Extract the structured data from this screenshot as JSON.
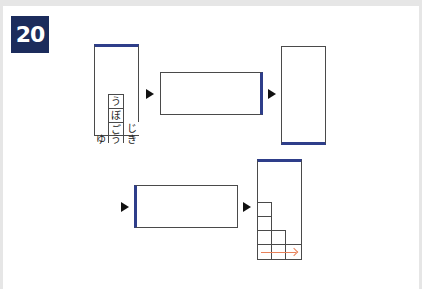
{
  "problem": {
    "number": "20"
  },
  "colors": {
    "badge_bg": "#1c2c5c",
    "accent": "#2e3e8a",
    "arrow_hint": "#e8825a"
  },
  "step1_grid": {
    "cells": [
      {
        "id": "u1",
        "char": "う"
      },
      {
        "id": "bo",
        "char": "ぼ"
      },
      {
        "id": "go",
        "char": "ご"
      },
      {
        "id": "ji",
        "char": "じ"
      },
      {
        "id": "yu",
        "char": "ゆ"
      },
      {
        "id": "u2",
        "char": "う"
      },
      {
        "id": "ki",
        "char": "き"
      }
    ]
  },
  "icons": {
    "step_arrow": "right-triangle-icon",
    "direction_hint": "right-arrow-icon"
  }
}
